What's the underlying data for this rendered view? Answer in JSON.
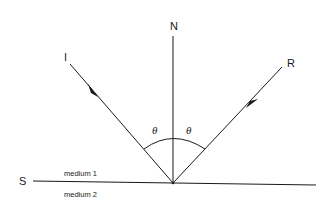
{
  "diagram": {
    "labels": {
      "normal": "N",
      "incident": "I",
      "reflected": "R",
      "surface": "S",
      "angle_incident": "θ",
      "angle_reflected": "θ",
      "medium_top": "medium 1",
      "medium_bottom": "medium 2"
    },
    "colors": {
      "line": "#1a1a1a",
      "background": "#ffffff"
    }
  }
}
